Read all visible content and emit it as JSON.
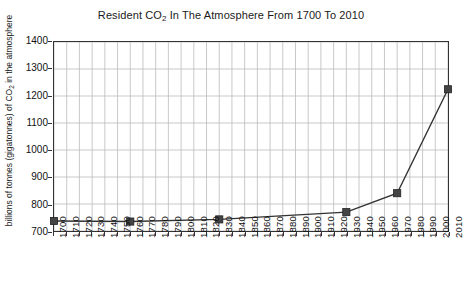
{
  "chart_data": {
    "type": "line",
    "title": "Resident CO2 In The Atmosphere From 1700 To 2010",
    "title_prefix": "Resident CO",
    "title_sub": "2",
    "title_suffix": " In The Atmosphere From 1700 To 2010",
    "xlabel": "",
    "ylabel": "billions of tonnes (gigatonnes) of CO2 in the atmosphere",
    "ylabel_prefix": "billions of tonnes (gigatonnes) of CO",
    "ylabel_sub": "2",
    "ylabel_suffix": " in the atmosphere",
    "ylim": [
      700,
      1400
    ],
    "ytick_values": [
      700,
      800,
      900,
      1000,
      1100,
      1200,
      1300,
      1400
    ],
    "ytick_labels": [
      "700",
      "800",
      "900",
      "1000",
      "1100",
      "1200",
      "1300",
      "1400"
    ],
    "xlim": [
      1700,
      2010
    ],
    "xtick_labels": [
      "1700",
      "1710",
      "1720",
      "1730",
      "1740",
      "1750",
      "1760",
      "1770",
      "1780",
      "1790",
      "1800",
      "1810",
      "1820",
      "1830",
      "1840",
      "1850",
      "1860",
      "1870",
      "1880",
      "1890",
      "1900",
      "1910",
      "1920",
      "1930",
      "1940",
      "1950",
      "1960",
      "1970",
      "1980",
      "1990",
      "2000",
      "2010"
    ],
    "grid": true,
    "legend": false,
    "marker": "square",
    "series": [
      {
        "name": "Resident CO2",
        "x": [
          1700,
          1760,
          1830,
          1930,
          1970,
          2010
        ],
        "values": [
          737,
          735,
          743,
          770,
          840,
          1225
        ]
      }
    ],
    "colors": {
      "line": "#333333",
      "marker": "#444444",
      "grid": "#bbbbbb",
      "axis": "#333333",
      "background": "#ffffff",
      "text": "#111111"
    }
  }
}
